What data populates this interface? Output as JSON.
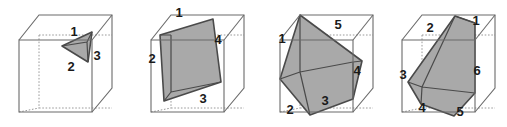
{
  "figure": {
    "background_color": "#ffffff",
    "panel_count": 4,
    "colors": {
      "section_fill": "#a9a9a9",
      "section_fill_dark": "#8f8f8f",
      "section_stroke": "#4a4a4a",
      "cube_visible_edge": "#6b6b6b",
      "cube_hidden_edge": "#9a9a9a",
      "label_text": "#1a1a1a"
    },
    "panels": [
      {
        "id": "panel-triangle",
        "name": "triangular-cross-section",
        "section_sides": 3,
        "labels": [
          {
            "text": "1",
            "x": 74,
            "y": 33
          },
          {
            "text": "2",
            "x": 71,
            "y": 68
          },
          {
            "text": "3",
            "x": 97,
            "y": 57
          }
        ]
      },
      {
        "id": "panel-quadrilateral",
        "name": "quadrilateral-cross-section",
        "section_sides": 4,
        "labels": [
          {
            "text": "1",
            "x": 52,
            "y": 14
          },
          {
            "text": "2",
            "x": 25,
            "y": 60
          },
          {
            "text": "3",
            "x": 76,
            "y": 100
          },
          {
            "text": "4",
            "x": 91,
            "y": 41
          }
        ]
      },
      {
        "id": "panel-pentagon",
        "name": "pentagonal-cross-section",
        "section_sides": 5,
        "labels": [
          {
            "text": "1",
            "x": 28,
            "y": 40
          },
          {
            "text": "2",
            "x": 36,
            "y": 111
          },
          {
            "text": "3",
            "x": 71,
            "y": 102
          },
          {
            "text": "4",
            "x": 103,
            "y": 72
          },
          {
            "text": "5",
            "x": 84,
            "y": 26
          }
        ]
      },
      {
        "id": "panel-hexagon",
        "name": "hexagonal-cross-section",
        "section_sides": 6,
        "labels": [
          {
            "text": "1",
            "x": 96,
            "y": 22
          },
          {
            "text": "2",
            "x": 50,
            "y": 29
          },
          {
            "text": "3",
            "x": 23,
            "y": 76
          },
          {
            "text": "4",
            "x": 42,
            "y": 109
          },
          {
            "text": "5",
            "x": 80,
            "y": 113
          },
          {
            "text": "6",
            "x": 97,
            "y": 72
          }
        ]
      }
    ]
  }
}
